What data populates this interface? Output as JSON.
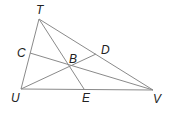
{
  "diagram": {
    "type": "triangle-cevians",
    "stroke_color": "#8a8a8a",
    "label_color": "#222222",
    "points": {
      "T": {
        "x": 39,
        "y": 19
      },
      "U": {
        "x": 21,
        "y": 89
      },
      "V": {
        "x": 153,
        "y": 90
      },
      "C": {
        "x": 30,
        "y": 53
      },
      "D": {
        "x": 96,
        "y": 54
      },
      "E": {
        "x": 84,
        "y": 89
      },
      "B": {
        "x": 71,
        "y": 66
      }
    },
    "labels": {
      "T": "T",
      "U": "U",
      "V": "V",
      "C": "C",
      "D": "D",
      "E": "E",
      "B": "B"
    },
    "segments": [
      [
        "T",
        "U"
      ],
      [
        "U",
        "V"
      ],
      [
        "T",
        "V"
      ],
      [
        "T",
        "E"
      ],
      [
        "U",
        "D"
      ],
      [
        "V",
        "C"
      ]
    ]
  }
}
